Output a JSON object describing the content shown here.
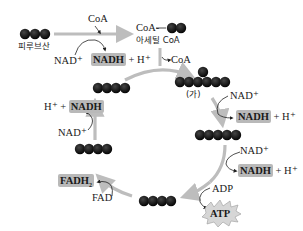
{
  "colors": {
    "arrow": "#bdbdbd",
    "molecule": "#111111",
    "highlight": "#b9b9b9",
    "text": "#1a1a1a"
  },
  "link_reaction": {
    "pyruvate_label": "피루브산",
    "pyruvate_carbons": 3,
    "coa_in": "CoA",
    "nad": "NAD⁺",
    "nadh": "NADH",
    "h": "+ H⁺",
    "acetyl_coa_prefix": "CoA-",
    "acetyl_coa_label": "아세틸 CoA",
    "acetyl_carbons": 2
  },
  "cycle": {
    "coa_out": "CoA",
    "citrate_label": "(가)",
    "citrate_carbons": 6,
    "step1": {
      "nad": "NAD⁺",
      "nadh": "NADH",
      "h": "+ H⁺"
    },
    "c5_carbons": 5,
    "step2": {
      "nad": "NAD⁺",
      "nadh": "NADH",
      "h": "+ H⁺"
    },
    "step3": {
      "adp": "ADP",
      "atp": "ATP"
    },
    "c4a_carbons": 4,
    "step4": {
      "fad": "FAD",
      "fadh2": "FADH",
      "fadh2_sub": "2"
    },
    "c4b_carbons": 4,
    "step5": {
      "nad": "NAD⁺",
      "h": "H⁺ +",
      "nadh": "NADH"
    },
    "c4c_carbons": 4
  }
}
